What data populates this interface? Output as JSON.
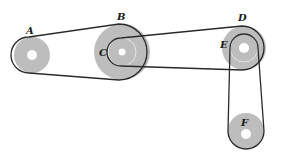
{
  "diagram": {
    "type": "belt-pulley-system",
    "labels": {
      "A": "A",
      "B": "B",
      "C": "C",
      "D": "D",
      "E": "E",
      "F": "F"
    },
    "pulleys": [
      {
        "id": "A",
        "cx": 32,
        "cy": 55,
        "r": 18,
        "hole_r": 5
      },
      {
        "id": "B",
        "cx": 122,
        "cy": 52,
        "r": 28,
        "hole_r": 3.5
      },
      {
        "id": "C",
        "cx": 122,
        "cy": 52,
        "r": 14,
        "coaxial_with": "B"
      },
      {
        "id": "D",
        "cx": 244,
        "cy": 48,
        "r": 22,
        "hole_r": 5
      },
      {
        "id": "E",
        "cx": 244,
        "cy": 48,
        "r": 14,
        "coaxial_with": "D"
      },
      {
        "id": "F",
        "cx": 246,
        "cy": 131,
        "r": 18,
        "hole_r": 5
      }
    ],
    "belts": [
      {
        "from": "A",
        "to": "B"
      },
      {
        "from": "C",
        "to": "D"
      },
      {
        "from": "E",
        "to": "F"
      }
    ],
    "colors": {
      "pulley_fill": "#bdbdbd",
      "belt_stroke": "#2a2a2a",
      "background": "#ffffff"
    }
  }
}
